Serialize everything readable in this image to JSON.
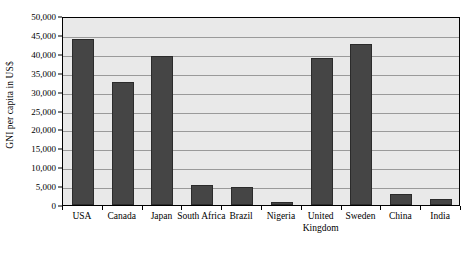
{
  "chart_data": {
    "type": "bar",
    "title": "",
    "xlabel": "",
    "ylabel": "GNI per capita in US$",
    "categories": [
      "USA",
      "Canada",
      "Japan",
      "South Africa",
      "Brazil",
      "Nigeria",
      "United Kingdom",
      "Sweden",
      "China",
      "India"
    ],
    "values": [
      44000,
      32600,
      39500,
      5400,
      4700,
      800,
      39000,
      42500,
      3000,
      1500
    ],
    "ylim": [
      0,
      50000
    ],
    "ytick_step": 5000,
    "ytick_labels": [
      "50,000",
      "45,000",
      "40,000",
      "35,000",
      "30,000",
      "25,000",
      "20,000",
      "15,000",
      "10,000",
      "5,000",
      "0"
    ],
    "ytick_values": [
      50000,
      45000,
      40000,
      35000,
      30000,
      25000,
      20000,
      15000,
      10000,
      5000,
      0
    ],
    "grid": true,
    "legend": false,
    "legend_position": "none",
    "colors": {
      "bar_fill": "#454545",
      "bar_border": "#2b2b2b",
      "plot_background": "#e9e9e9",
      "gridline": "#9a9a9a",
      "axis_line": "#000000",
      "text": "#000000",
      "page_background": "#ffffff"
    }
  }
}
